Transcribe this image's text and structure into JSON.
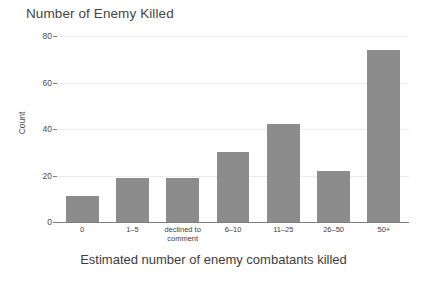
{
  "chart_data": {
    "type": "bar",
    "title": "Number of Enemy Killed",
    "xlabel": "Estimated number of enemy combatants killed",
    "ylabel": "Count",
    "categories": [
      "0",
      "1–5",
      "declined to comment",
      "6–10",
      "11–25",
      "26–50",
      "50+"
    ],
    "values": [
      11,
      19,
      19,
      30,
      42,
      22,
      74
    ],
    "ylim": [
      0,
      80
    ],
    "yticks": [
      0,
      20,
      40,
      60,
      80
    ],
    "ytick_labels": [
      "0",
      "20",
      "40",
      "60",
      "80"
    ],
    "grid": true,
    "legend": false,
    "bar_color": "#8c8c8c",
    "background_color": "#ffffff",
    "gridline_color": "#ececec",
    "axis_color": "#7d7d7d"
  }
}
